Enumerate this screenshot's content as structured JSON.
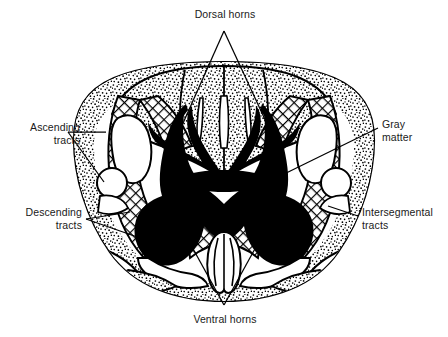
{
  "figure": {
    "colors": {
      "gray_matter_fill": "#000000",
      "background": "#ffffff",
      "outline": "#000000",
      "stipple": "#000000",
      "crosshatch": "#000000",
      "label_text": "#1a1a1a"
    }
  },
  "labels": {
    "dorsal_horns": "Dorsal horns",
    "ventral_horns": "Ventral horns",
    "ascending_tracts_line1": "Ascending",
    "ascending_tracts_line2": "tracts",
    "descending_tracts_line1": "Descending",
    "descending_tracts_line2": "tracts",
    "gray_matter_line1": "Gray",
    "gray_matter_line2": "matter",
    "intersegmental_tracts_line1": "Intersegmental",
    "intersegmental_tracts_line2": "tracts"
  },
  "structures": [
    {
      "name": "gray-matter",
      "style": "solid-black",
      "label": "Gray matter"
    },
    {
      "name": "dorsal-horn-left",
      "style": "solid-black",
      "label": "Dorsal horns"
    },
    {
      "name": "dorsal-horn-right",
      "style": "solid-black",
      "label": "Dorsal horns"
    },
    {
      "name": "ventral-horn-left",
      "style": "solid-black",
      "label": "Ventral horns"
    },
    {
      "name": "ventral-horn-right",
      "style": "solid-black",
      "label": "Ventral horns"
    },
    {
      "name": "ascending-tracts",
      "style": "stippled",
      "label": "Ascending tracts"
    },
    {
      "name": "descending-tracts",
      "style": "stippled",
      "label": "Descending tracts"
    },
    {
      "name": "intersegmental-tracts",
      "style": "crosshatched",
      "label": "Intersegmental tracts"
    }
  ]
}
